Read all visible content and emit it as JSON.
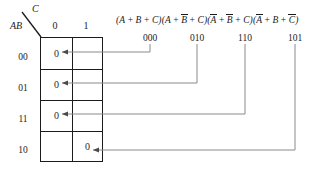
{
  "kmap": {
    "corner": {
      "row_var": "AB",
      "col_var": "C"
    },
    "col_headers": [
      "0",
      "1"
    ],
    "row_headers": [
      "00",
      "01",
      "11",
      "10"
    ],
    "cells": [
      {
        "row": "00",
        "col": "0",
        "value": "0"
      },
      {
        "row": "00",
        "col": "1",
        "value": ""
      },
      {
        "row": "01",
        "col": "0",
        "value": "0"
      },
      {
        "row": "01",
        "col": "1",
        "value": ""
      },
      {
        "row": "11",
        "col": "0",
        "value": "0"
      },
      {
        "row": "11",
        "col": "1",
        "value": ""
      },
      {
        "row": "10",
        "col": "0",
        "value": ""
      },
      {
        "row": "10",
        "col": "1",
        "value": "0"
      }
    ]
  },
  "expression": {
    "terms": [
      {
        "literals": [
          "A",
          "B",
          "C"
        ],
        "bars": [
          false,
          false,
          false
        ]
      },
      {
        "literals": [
          "A",
          "B",
          "C"
        ],
        "bars": [
          false,
          true,
          false
        ]
      },
      {
        "literals": [
          "A",
          "B",
          "C"
        ],
        "bars": [
          true,
          true,
          false
        ]
      },
      {
        "literals": [
          "A",
          "B",
          "C"
        ],
        "bars": [
          true,
          false,
          true
        ]
      }
    ],
    "plain_text": "(A + B + C)(A + B̄ + C)(Ā + B̄ + C)(Ā + B + C̄)"
  },
  "binary_codes": [
    {
      "code": "000",
      "x": 150,
      "target_row": "00",
      "target_col": "0"
    },
    {
      "code": "010",
      "x": 197,
      "target_row": "01",
      "target_col": "0"
    },
    {
      "code": "110",
      "x": 245,
      "target_row": "11",
      "target_col": "0"
    },
    {
      "code": "101",
      "x": 295,
      "target_row": "10",
      "target_col": "1"
    }
  ],
  "colors": {
    "ink": "#1b1b1b",
    "leader": "#8a8a8a",
    "background": "#ffffff"
  }
}
